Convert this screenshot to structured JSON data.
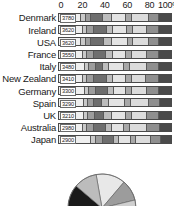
{
  "chart_data": {
    "type": "bar",
    "title": "",
    "subtitle": "",
    "xlabel": "",
    "ylabel": "",
    "orientation": "horizontal",
    "stacked": true,
    "normalized_percent": true,
    "xlim": [
      0,
      100
    ],
    "grid": false,
    "legend_position": "none",
    "axis_ticks": [
      {
        "label": "0",
        "value": 0
      },
      {
        "label": "20",
        "value": 20
      },
      {
        "label": "40",
        "value": 40
      },
      {
        "label": "60",
        "value": 60
      },
      {
        "label": "80",
        "value": 80
      },
      {
        "label": "100%",
        "value": 100
      }
    ],
    "categories": [
      "Denmark",
      "Ireland",
      "USA",
      "France",
      "Italy",
      "New Zealand",
      "Germany",
      "Spain",
      "UK",
      "Australia",
      "Japan"
    ],
    "data_labels": [
      "3780",
      "3620",
      "3620",
      "3550",
      "3480",
      "3410",
      "3300",
      "3290",
      "3210",
      "2980",
      "2900"
    ],
    "series": [
      {
        "name": "segment-1",
        "color": "#efefef",
        "values": [
          20,
          21,
          20,
          21,
          23,
          21,
          23,
          22,
          22,
          21,
          29
        ]
      },
      {
        "name": "segment-2",
        "color": "#c9c9c9",
        "values": [
          4,
          4,
          4,
          4,
          4,
          4,
          4,
          4,
          4,
          4,
          4
        ]
      },
      {
        "name": "segment-3",
        "color": "#9d9d9d",
        "values": [
          5,
          6,
          5,
          6,
          6,
          6,
          6,
          5,
          6,
          6,
          6
        ]
      },
      {
        "name": "segment-4",
        "color": "#6e6e6e",
        "values": [
          10,
          12,
          11,
          11,
          6,
          12,
          11,
          7,
          8,
          11,
          10
        ]
      },
      {
        "name": "segment-5",
        "color": "#bdbdbd",
        "values": [
          8,
          5,
          7,
          6,
          6,
          5,
          5,
          7,
          7,
          5,
          5
        ]
      },
      {
        "name": "segment-6",
        "color": "#e4e4e4",
        "values": [
          13,
          13,
          15,
          12,
          13,
          12,
          11,
          14,
          13,
          11,
          10
        ]
      },
      {
        "name": "segment-7",
        "color": "#a8a8a8",
        "values": [
          5,
          5,
          4,
          5,
          5,
          5,
          5,
          5,
          5,
          5,
          5
        ]
      },
      {
        "name": "segment-8",
        "color": "#dcdcdc",
        "values": [
          15,
          13,
          14,
          14,
          16,
          13,
          14,
          16,
          14,
          16,
          13
        ]
      },
      {
        "name": "segment-9",
        "color": "#8f8f8f",
        "values": [
          9,
          10,
          9,
          10,
          10,
          11,
          10,
          10,
          10,
          11,
          9
        ]
      },
      {
        "name": "segment-10",
        "color": "#4a4a4a",
        "values": [
          11,
          11,
          11,
          11,
          11,
          11,
          11,
          10,
          11,
          10,
          9
        ]
      }
    ],
    "pie": {
      "type": "pie",
      "note": "partially visible pie chart at bottom of image, cropped",
      "slices": [
        {
          "name": "slice-1",
          "value": 14,
          "color": "#e8e8e8"
        },
        {
          "name": "slice-2",
          "value": 10,
          "color": "#9c9c9c"
        },
        {
          "name": "slice-3",
          "value": 9,
          "color": "#cfcfcf"
        },
        {
          "name": "slice-4",
          "value": 12,
          "color": "#7a7a7a"
        },
        {
          "name": "slice-5",
          "value": 8,
          "color": "#2b2b2b"
        },
        {
          "name": "slice-6",
          "value": 13,
          "color": "#efefef"
        },
        {
          "name": "slice-7",
          "value": 11,
          "color": "#606060"
        },
        {
          "name": "slice-8",
          "value": 12,
          "color": "#1a1a1a"
        },
        {
          "name": "slice-9",
          "value": 11,
          "color": "#bcbcbc"
        }
      ]
    }
  }
}
